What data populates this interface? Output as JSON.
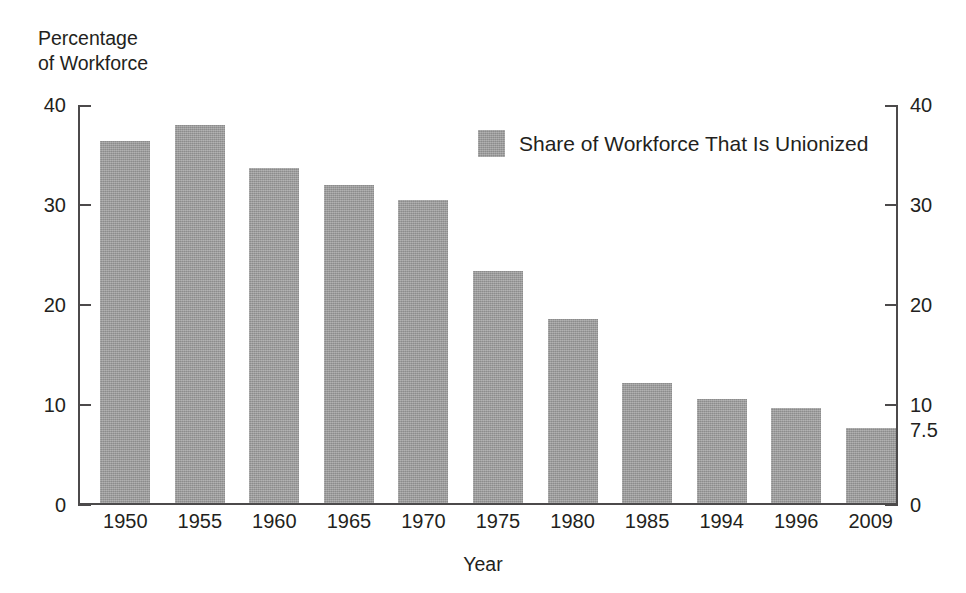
{
  "chart_data": {
    "type": "bar",
    "title": "",
    "ylabel": "Percentage of Workforce",
    "ylabel_lines": [
      "Percentage",
      "of Workforce"
    ],
    "xlabel": "Year",
    "categories": [
      "1950",
      "1955",
      "1960",
      "1965",
      "1970",
      "1975",
      "1980",
      "1985",
      "1994",
      "1996",
      "2009"
    ],
    "values": [
      36.2,
      37.8,
      33.5,
      31.8,
      30.3,
      23.2,
      18.4,
      12.0,
      10.4,
      9.5,
      7.5
    ],
    "series": [
      {
        "name": "Share of Workforce That Is Unionized",
        "values": [
          36.2,
          37.8,
          33.5,
          31.8,
          30.3,
          23.2,
          18.4,
          12.0,
          10.4,
          9.5,
          7.5
        ]
      }
    ],
    "ylim": [
      0,
      40
    ],
    "yticks_left": [
      "0",
      "10",
      "20",
      "30",
      "40"
    ],
    "yticks_left_values": [
      0,
      10,
      20,
      30,
      40
    ],
    "yticks_right": [
      "0",
      "7.5",
      "10",
      "20",
      "30",
      "40"
    ],
    "yticks_right_values": [
      0,
      7.5,
      10,
      20,
      30,
      40
    ],
    "grid": false,
    "legend": {
      "position": "upper-right-inside",
      "entries": [
        {
          "label": "Share of Workforce That Is Unionized",
          "color": "#999999"
        }
      ]
    },
    "colors": {
      "bar": "#999999",
      "axis": "#4c4a4b",
      "text": "#231f20",
      "background": "#ffffff"
    }
  }
}
